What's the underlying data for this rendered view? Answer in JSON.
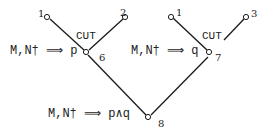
{
  "diagram": {
    "type": "proof-tree",
    "left_branch": {
      "sequent": "M,N† ⟹ p",
      "rule": "CUT",
      "node": "6",
      "premises": [
        "1",
        "2"
      ]
    },
    "right_branch": {
      "sequent": "M,N† ⟹ q",
      "rule": "CUT",
      "node": "7",
      "premises": [
        "1",
        "3"
      ]
    },
    "root": {
      "sequent": "M,N† ⟹ p∧q",
      "node": "8"
    },
    "line_color": "#1a1a1a"
  }
}
